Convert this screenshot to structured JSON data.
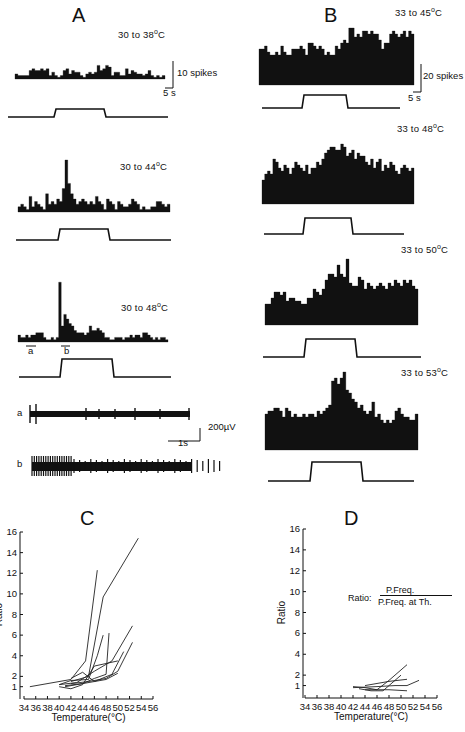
{
  "figure": {
    "panels": {
      "A": {
        "letter": "A",
        "traces": [
          {
            "label_pre": "30 to 38",
            "label_unit": "C",
            "deg": "o"
          },
          {
            "label_pre": "30 to 44",
            "label_unit": "C",
            "deg": "o"
          },
          {
            "label_pre": "30 to 48",
            "label_unit": "C",
            "deg": "o"
          }
        ],
        "scale_y": "10 spikes",
        "scale_x": "5 s",
        "marker_a": "a",
        "marker_b": "b",
        "raw": {
          "label_a": "a",
          "label_b": "b",
          "scale_y": "200µV",
          "scale_x": "1s"
        }
      },
      "B": {
        "letter": "B",
        "traces": [
          {
            "label_pre": "33 to 45",
            "label_unit": "C",
            "deg": "o"
          },
          {
            "label_pre": "33 to 48",
            "label_unit": "C",
            "deg": "o"
          },
          {
            "label_pre": "33 to 50",
            "label_unit": "C",
            "deg": "o"
          },
          {
            "label_pre": "33 to 53",
            "label_unit": "C",
            "deg": "o"
          }
        ],
        "scale_y": "20 spikes",
        "scale_x": "5 s"
      },
      "C": {
        "letter": "C"
      },
      "D": {
        "letter": "D",
        "formula_lhs": "Ratio:",
        "formula_num": "P.Freq.",
        "formula_den": "P.Freq. at Th."
      }
    }
  },
  "chart_data": [
    {
      "type": "line",
      "title": "C",
      "xlabel": "Temperature(°C)",
      "ylabel": "Ratio",
      "xlim": [
        34,
        56
      ],
      "ylim": [
        0,
        16
      ],
      "xticks": [
        34,
        36,
        38,
        40,
        42,
        44,
        46,
        48,
        50,
        52,
        54,
        56
      ],
      "yticks": [
        1,
        2,
        4,
        6,
        8,
        10,
        12,
        14,
        16
      ],
      "grid": false,
      "series": [
        {
          "name": "unit1",
          "x": [
            35,
            42,
            44.5,
            46.5
          ],
          "y": [
            1,
            1.7,
            3.5,
            12.3
          ]
        },
        {
          "name": "unit2",
          "x": [
            42,
            45,
            47.5,
            53.5
          ],
          "y": [
            1.5,
            2,
            9.7,
            15.4
          ]
        },
        {
          "name": "unit3",
          "x": [
            40,
            42,
            45,
            46.5,
            47.5
          ],
          "y": [
            1.2,
            1.6,
            1.7,
            4,
            6
          ]
        },
        {
          "name": "unit4",
          "x": [
            41,
            44,
            46,
            48,
            48.5
          ],
          "y": [
            1.1,
            1.3,
            1.8,
            2.2,
            6.2
          ]
        },
        {
          "name": "unit5",
          "x": [
            40,
            43,
            46,
            49,
            52.5
          ],
          "y": [
            1.2,
            1.4,
            2.5,
            3.5,
            6.9
          ]
        },
        {
          "name": "unit6",
          "x": [
            42,
            45,
            48,
            50,
            52.5
          ],
          "y": [
            1.3,
            1.5,
            1.8,
            2.5,
            5.3
          ]
        },
        {
          "name": "unit7",
          "x": [
            41,
            43,
            46,
            49,
            51
          ],
          "y": [
            1.0,
            1.2,
            1.5,
            2.2,
            4.4
          ]
        },
        {
          "name": "unit8",
          "x": [
            40,
            42,
            44,
            46,
            50
          ],
          "y": [
            1.0,
            0.8,
            1.2,
            3,
            3.5
          ]
        },
        {
          "name": "unit9",
          "x": [
            42,
            44,
            46,
            48,
            50
          ],
          "y": [
            1.8,
            2.4,
            1.5,
            1.7,
            2.3
          ]
        }
      ]
    },
    {
      "type": "line",
      "title": "D",
      "xlabel": "Temperature(°C)",
      "ylabel": "Ratio",
      "xlim": [
        34,
        56
      ],
      "ylim": [
        0,
        16
      ],
      "xticks": [
        34,
        36,
        38,
        40,
        42,
        44,
        46,
        48,
        50,
        52,
        54,
        56
      ],
      "yticks": [
        1,
        2,
        4,
        6,
        8,
        10,
        12,
        14,
        16
      ],
      "grid": false,
      "annotation": "Ratio: P.Freq. / P.Freq. at Th.",
      "series": [
        {
          "name": "unit1",
          "x": [
            42,
            44,
            46,
            48,
            51
          ],
          "y": [
            0.9,
            0.8,
            0.6,
            1.5,
            3.0
          ]
        },
        {
          "name": "unit2",
          "x": [
            44,
            48,
            51
          ],
          "y": [
            1.0,
            1.4,
            1.6
          ]
        },
        {
          "name": "unit3",
          "x": [
            42,
            46,
            49,
            51,
            53
          ],
          "y": [
            0.8,
            0.9,
            1.0,
            1.0,
            1.5
          ]
        },
        {
          "name": "unit4",
          "x": [
            43,
            45,
            47,
            48,
            50
          ],
          "y": [
            0.7,
            0.5,
            0.5,
            1.0,
            2.0
          ]
        },
        {
          "name": "unit5",
          "x": [
            44,
            48,
            51
          ],
          "y": [
            0.6,
            0.6,
            0.5
          ]
        }
      ]
    }
  ],
  "histograms": {
    "A1": [
      3,
      2,
      2,
      2,
      2,
      5,
      6,
      5,
      5,
      6,
      5,
      6,
      2,
      4,
      2,
      1,
      2,
      5,
      6,
      3,
      5,
      4,
      4,
      2,
      1,
      3,
      4,
      3,
      4,
      8,
      5,
      6,
      8,
      7,
      2,
      4,
      4,
      2,
      2,
      6,
      3,
      5,
      4,
      3,
      3,
      2,
      3,
      5,
      2,
      1,
      2,
      1,
      2
    ],
    "A2": [
      2,
      3,
      2,
      1,
      6,
      2,
      4,
      3,
      2,
      1,
      7,
      3,
      4,
      3,
      5,
      4,
      9,
      20,
      11,
      7,
      5,
      3,
      4,
      5,
      4,
      3,
      4,
      3,
      6,
      4,
      3,
      1,
      5,
      4,
      3,
      1,
      4,
      3,
      2,
      2,
      3,
      5,
      4,
      3,
      1,
      2,
      1,
      1,
      2,
      2,
      4,
      4,
      3,
      2,
      3
    ],
    "A3": [
      3,
      2,
      2,
      3,
      2,
      3,
      3,
      4,
      4,
      4,
      2,
      1,
      1,
      2,
      1,
      2,
      26,
      7,
      12,
      10,
      8,
      7,
      5,
      4,
      4,
      4,
      3,
      4,
      7,
      5,
      5,
      6,
      5,
      4,
      2,
      2,
      1,
      1,
      2,
      2,
      2,
      1,
      2,
      2,
      3,
      2,
      3,
      3,
      2,
      4,
      4,
      3,
      2,
      1,
      2,
      1,
      2,
      2,
      1
    ],
    "B1": [
      12,
      12,
      13,
      11,
      10,
      10,
      11,
      10,
      13,
      11,
      10,
      10,
      12,
      12,
      12,
      13,
      12,
      10,
      14,
      14,
      13,
      12,
      13,
      12,
      10,
      11,
      10,
      10,
      13,
      12,
      14,
      15,
      14,
      19,
      19,
      16,
      17,
      16,
      18,
      18,
      17,
      18,
      17,
      17,
      15,
      12,
      14,
      14,
      17,
      18,
      17,
      16,
      17,
      18,
      16,
      18,
      17
    ],
    "B2": [
      8,
      10,
      11,
      10,
      15,
      14,
      12,
      11,
      13,
      12,
      10,
      12,
      14,
      13,
      12,
      11,
      13,
      10,
      12,
      12,
      14,
      13,
      15,
      17,
      18,
      19,
      19,
      18,
      18,
      20,
      19,
      16,
      17,
      18,
      15,
      17,
      16,
      16,
      14,
      13,
      15,
      12,
      14,
      15,
      11,
      13,
      12,
      14,
      13,
      11,
      10,
      12,
      13,
      12,
      11,
      12
    ],
    "B3": [
      7,
      7,
      9,
      11,
      11,
      10,
      11,
      8,
      9,
      9,
      8,
      8,
      7,
      7,
      9,
      9,
      12,
      11,
      10,
      12,
      15,
      17,
      17,
      16,
      20,
      17,
      16,
      22,
      14,
      13,
      13,
      16,
      15,
      12,
      14,
      13,
      12,
      13,
      14,
      13,
      12,
      14,
      13,
      15,
      14,
      13,
      15,
      14,
      15,
      13,
      12
    ],
    "B4": [
      12,
      13,
      13,
      14,
      14,
      13,
      11,
      14,
      13,
      11,
      12,
      11,
      11,
      12,
      11,
      12,
      12,
      11,
      13,
      12,
      13,
      14,
      15,
      23,
      24,
      22,
      24,
      26,
      20,
      19,
      17,
      16,
      14,
      15,
      13,
      12,
      13,
      16,
      11,
      12,
      10,
      9,
      10,
      9,
      10,
      13,
      14,
      12,
      11,
      11,
      10,
      10,
      12
    ]
  }
}
